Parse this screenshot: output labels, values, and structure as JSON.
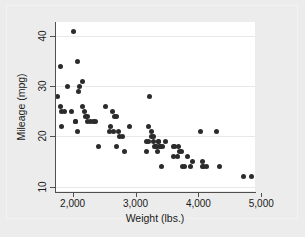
{
  "chart_data": {
    "type": "scatter",
    "title": "",
    "subtitle": "",
    "xlabel": "Weight (lbs.)",
    "ylabel": "Mileage (mpg)",
    "xlim": [
      1720,
      4900
    ],
    "ylim": [
      9.1,
      42.8
    ],
    "xticks": [
      2000,
      3000,
      4000,
      5000
    ],
    "xticklabels": [
      "2,000",
      "3,000",
      "4,000",
      "5,000"
    ],
    "yticks": [
      10,
      20,
      30,
      40
    ],
    "yticklabels": [
      "10",
      "20",
      "30",
      "40"
    ],
    "grid": "horizontal",
    "legend": "none",
    "marker": {
      "shape": "circle",
      "color": "#2b2b2b",
      "size": 5
    },
    "background": {
      "canvas": "#ececec",
      "plot": "#ffffff",
      "gridline": "#e8e8e8",
      "axis": "#4f4f4f"
    },
    "series": [
      {
        "name": "Mileage vs Weight",
        "points": [
          [
            1760,
            28
          ],
          [
            1800,
            34
          ],
          [
            1800,
            26
          ],
          [
            1830,
            25
          ],
          [
            1830,
            22
          ],
          [
            1870,
            25
          ],
          [
            1920,
            30
          ],
          [
            1980,
            25
          ],
          [
            2020,
            41
          ],
          [
            2040,
            23
          ],
          [
            2050,
            23
          ],
          [
            2070,
            35
          ],
          [
            2080,
            21
          ],
          [
            2100,
            29
          ],
          [
            2110,
            30
          ],
          [
            2160,
            31
          ],
          [
            2160,
            26
          ],
          [
            2190,
            25
          ],
          [
            2200,
            24
          ],
          [
            2230,
            24
          ],
          [
            2240,
            23
          ],
          [
            2280,
            23
          ],
          [
            2330,
            23
          ],
          [
            2370,
            23
          ],
          [
            2410,
            18
          ],
          [
            2520,
            26
          ],
          [
            2580,
            21
          ],
          [
            2600,
            22
          ],
          [
            2640,
            25
          ],
          [
            2650,
            21
          ],
          [
            2670,
            24
          ],
          [
            2690,
            24
          ],
          [
            2700,
            18
          ],
          [
            2730,
            21
          ],
          [
            2750,
            20
          ],
          [
            2800,
            20
          ],
          [
            2830,
            17
          ],
          [
            2900,
            22
          ],
          [
            3170,
            17
          ],
          [
            3180,
            19
          ],
          [
            3200,
            22
          ],
          [
            3210,
            19
          ],
          [
            3220,
            28
          ],
          [
            3250,
            21
          ],
          [
            3260,
            20
          ],
          [
            3280,
            20
          ],
          [
            3290,
            19
          ],
          [
            3300,
            18
          ],
          [
            3310,
            18
          ],
          [
            3330,
            18
          ],
          [
            3350,
            17
          ],
          [
            3360,
            19
          ],
          [
            3370,
            19
          ],
          [
            3380,
            18
          ],
          [
            3400,
            18
          ],
          [
            3420,
            14
          ],
          [
            3430,
            18
          ],
          [
            3470,
            19
          ],
          [
            3600,
            16
          ],
          [
            3610,
            18
          ],
          [
            3620,
            18
          ],
          [
            3670,
            16
          ],
          [
            3690,
            18
          ],
          [
            3700,
            17
          ],
          [
            3730,
            17
          ],
          [
            3740,
            14
          ],
          [
            3780,
            14
          ],
          [
            3830,
            16
          ],
          [
            3880,
            14
          ],
          [
            3900,
            15
          ],
          [
            4030,
            21
          ],
          [
            4060,
            15
          ],
          [
            4060,
            14
          ],
          [
            4080,
            14
          ],
          [
            4130,
            14
          ],
          [
            4290,
            21
          ],
          [
            4330,
            14
          ],
          [
            4720,
            12
          ],
          [
            4840,
            12
          ]
        ]
      }
    ]
  }
}
